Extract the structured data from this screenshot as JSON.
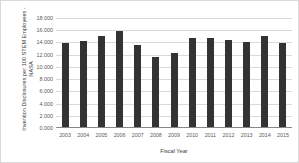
{
  "chart_data": {
    "type": "bar",
    "title": "",
    "xlabel": "Fiscal Year",
    "ylabel": "Invention Disclosures per 100 STEM Employees - NASA",
    "categories": [
      "2003",
      "2004",
      "2005",
      "2006",
      "2007",
      "2008",
      "2009",
      "2010",
      "2011",
      "2012",
      "2013",
      "2014",
      "2015"
    ],
    "values": [
      13.9,
      14.2,
      15.0,
      15.8,
      13.6,
      11.6,
      12.3,
      14.8,
      14.8,
      14.4,
      14.1,
      15.0,
      13.9
    ],
    "ylim": [
      0,
      18
    ],
    "ytick_labels": [
      "0.000",
      "2.000",
      "4.000",
      "6.000",
      "8.000",
      "10.000",
      "12.000",
      "14.000",
      "16.000",
      "18.000"
    ],
    "ytick_values": [
      0,
      2,
      4,
      6,
      8,
      10,
      12,
      14,
      16,
      18
    ],
    "grid": true,
    "legend": "none",
    "bar_color": "#333333",
    "gridline_color": "#d9d9d9",
    "axis_color": "#868686",
    "text_color": "#595959",
    "background_color": "#ffffff"
  }
}
